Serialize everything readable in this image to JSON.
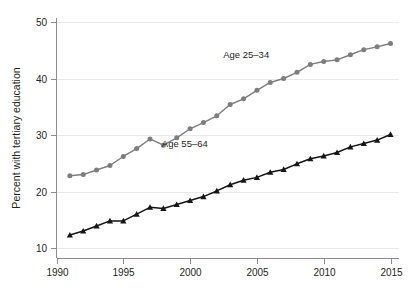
{
  "chart_data": {
    "type": "line",
    "title": "",
    "subtitle": "",
    "xlabel": "",
    "ylabel": "Percent with tertiary education",
    "xlim": [
      1990,
      2015
    ],
    "ylim": [
      10,
      50
    ],
    "xticks": [
      1990,
      1995,
      2000,
      2005,
      2010,
      2015
    ],
    "yticks": [
      10,
      20,
      30,
      40,
      50
    ],
    "grid": "horizontal",
    "legend_position": "inline-annotations",
    "x": [
      1991,
      1992,
      1993,
      1994,
      1995,
      1996,
      1997,
      1998,
      1999,
      2000,
      2001,
      2002,
      2003,
      2004,
      2005,
      2006,
      2007,
      2008,
      2009,
      2010,
      2011,
      2012,
      2013,
      2014,
      2015
    ],
    "series": [
      {
        "name": "Age 25–34",
        "color": "#7d7d7d",
        "marker": "circle",
        "label_text": "Age 25–34",
        "values": [
          22.8,
          23.0,
          23.8,
          24.6,
          26.2,
          27.6,
          29.3,
          28.2,
          29.5,
          31.1,
          32.2,
          33.4,
          35.4,
          36.4,
          37.9,
          39.3,
          40.0,
          41.1,
          42.5,
          43.0,
          43.3,
          44.2,
          45.1,
          45.6,
          46.2
        ]
      },
      {
        "name": "Age 55–64",
        "color": "#151515",
        "marker": "triangle",
        "label_text": "Age 55–64",
        "values": [
          12.3,
          13.0,
          13.9,
          14.8,
          14.8,
          16.0,
          17.2,
          17.0,
          17.7,
          18.4,
          19.1,
          20.1,
          21.2,
          22.0,
          22.5,
          23.4,
          23.9,
          24.9,
          25.8,
          26.3,
          26.9,
          27.9,
          28.5,
          29.1,
          30.1
        ]
      }
    ]
  },
  "annotations": [
    {
      "text": "Age 25–34",
      "x": 2004.2,
      "y": 43.6
    },
    {
      "text": "Age 55–64",
      "x": 1999.6,
      "y": 27.9
    }
  ],
  "axes": {
    "y_title": "Percent with tertiary education",
    "y_tick_labels": [
      "10",
      "20",
      "30",
      "40",
      "50"
    ],
    "x_tick_labels": [
      "1990",
      "1995",
      "2000",
      "2005",
      "2010",
      "2015"
    ]
  },
  "colors": {
    "series_gray": "#7d7d7d",
    "series_black": "#151515",
    "axis": "#8c8c8c",
    "grid": "#e9e9e9",
    "text": "#231f20",
    "background": "#ffffff"
  }
}
